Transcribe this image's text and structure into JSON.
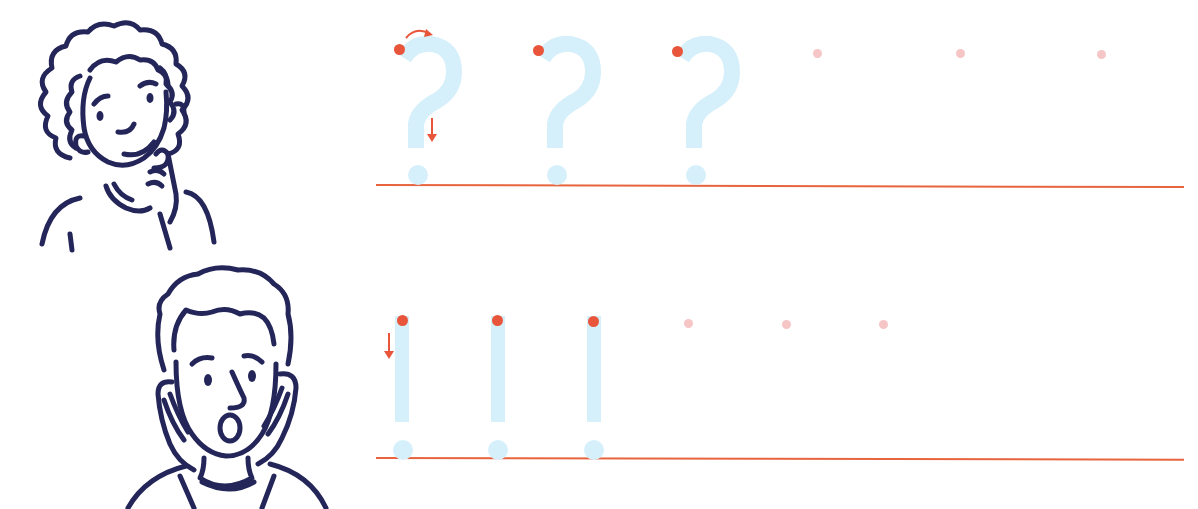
{
  "worksheet": {
    "colors": {
      "ink": "#24265a",
      "trace": "#d6f0fb",
      "accent": "#e8553a",
      "guide_dot": "#f6c6c6",
      "baseline": "#e8643f",
      "background": "#ffffff"
    },
    "rows": [
      {
        "symbol": "?",
        "symbol_name": "question-mark",
        "character": "thinking-girl",
        "traced_count": 3,
        "empty_practice_count": 3,
        "stroke_hints": [
          "curved-arrow-clockwise",
          "down-arrow"
        ]
      },
      {
        "symbol": "!",
        "symbol_name": "exclamation-mark",
        "character": "surprised-boy",
        "traced_count": 3,
        "empty_practice_count": 3,
        "stroke_hints": [
          "down-arrow"
        ]
      }
    ]
  }
}
